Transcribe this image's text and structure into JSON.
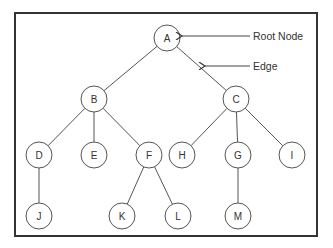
{
  "diagram": {
    "type": "tree",
    "frame": {
      "x": 15,
      "y": 13,
      "w": 302,
      "h": 223
    },
    "node_radius": 13,
    "nodes": [
      {
        "id": "A",
        "label": "A",
        "x": 167,
        "y": 38
      },
      {
        "id": "B",
        "label": "B",
        "x": 94,
        "y": 99
      },
      {
        "id": "C",
        "label": "C",
        "x": 236,
        "y": 99
      },
      {
        "id": "D",
        "label": "D",
        "x": 39,
        "y": 155
      },
      {
        "id": "E",
        "label": "E",
        "x": 94,
        "y": 155
      },
      {
        "id": "F",
        "label": "F",
        "x": 149,
        "y": 155
      },
      {
        "id": "H",
        "label": "H",
        "x": 182,
        "y": 155
      },
      {
        "id": "G",
        "label": "G",
        "x": 238,
        "y": 155
      },
      {
        "id": "I",
        "label": "I",
        "x": 292,
        "y": 155
      },
      {
        "id": "J",
        "label": "J",
        "x": 39,
        "y": 216
      },
      {
        "id": "K",
        "label": "K",
        "x": 122,
        "y": 216
      },
      {
        "id": "L",
        "label": "L",
        "x": 178,
        "y": 216
      },
      {
        "id": "M",
        "label": "M",
        "x": 238,
        "y": 216
      }
    ],
    "edges": [
      [
        "A",
        "B"
      ],
      [
        "A",
        "C"
      ],
      [
        "B",
        "D"
      ],
      [
        "B",
        "E"
      ],
      [
        "B",
        "F"
      ],
      [
        "C",
        "H"
      ],
      [
        "C",
        "G"
      ],
      [
        "C",
        "I"
      ],
      [
        "D",
        "J"
      ],
      [
        "F",
        "K"
      ],
      [
        "F",
        "L"
      ],
      [
        "G",
        "M"
      ]
    ],
    "annotations": [
      {
        "label": "Root Node",
        "text_x": 253,
        "text_y": 36,
        "line_from": [
          250,
          36
        ],
        "arrow_to": [
          182,
          36
        ]
      },
      {
        "label": "Edge",
        "text_x": 253,
        "text_y": 66,
        "line_from": [
          250,
          66
        ],
        "arrow_to": [
          205,
          66
        ]
      }
    ]
  },
  "colors": {
    "stroke": "#555555",
    "frame": "#333333",
    "text": "#333333",
    "background": "#ffffff"
  }
}
